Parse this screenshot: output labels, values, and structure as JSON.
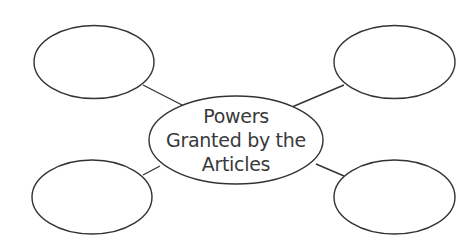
{
  "diagram": {
    "type": "concept-web",
    "central_node": {
      "lines": [
        "Powers",
        "Granted by the",
        "Articles"
      ],
      "text": "Powers Granted by the Articles"
    },
    "outer_nodes": [
      {
        "position": "top-left",
        "text": ""
      },
      {
        "position": "top-right",
        "text": ""
      },
      {
        "position": "bottom-left",
        "text": ""
      },
      {
        "position": "bottom-right",
        "text": ""
      }
    ],
    "colors": {
      "stroke": "#333333",
      "text": "#3a3a3a",
      "background": "#ffffff"
    }
  }
}
